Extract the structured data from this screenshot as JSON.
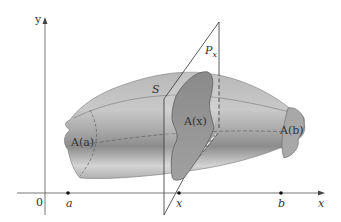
{
  "figure": {
    "type": "solid-volume-by-cross-sections",
    "axes": {
      "y_label": "y",
      "x_label": "x",
      "origin_label": "0"
    },
    "points": [
      {
        "label": "a",
        "x_px": 68
      },
      {
        "label": "x",
        "x_px": 179
      },
      {
        "label": "b",
        "x_px": 281
      }
    ],
    "labels": {
      "solid": "S",
      "plane": "P",
      "plane_subscript": "x",
      "cross_section_a": "A(a)",
      "cross_section_x": "A(x)",
      "cross_section_b": "A(b)"
    },
    "colors": {
      "solid_fill_light": "#d9d9d9",
      "solid_fill_dark": "#8f8f8f",
      "cross_section": "#9a9a9a",
      "axis": "#555555",
      "line": "#333333"
    }
  }
}
